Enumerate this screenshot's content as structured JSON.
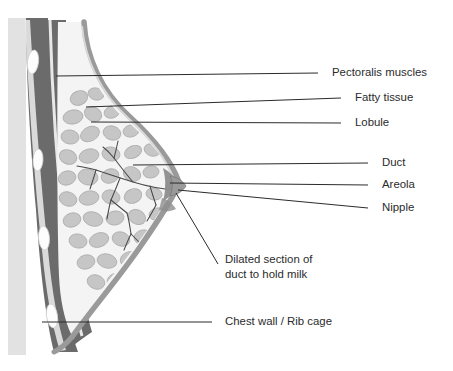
{
  "diagram": {
    "background_color": "#ffffff",
    "line_color": "#2b2b2b",
    "text_color": "#2b2b2b",
    "palette": {
      "muscle_dark": "#6b6b6b",
      "skin_band": "#9a9a9a",
      "lobule_gray": "#c6c6c6",
      "lobule_edge": "#b0b0b0",
      "tissue_light": "#f4f4f4",
      "rib_white": "#fdfdfd",
      "chest_wall_light": "#e2e2e2",
      "duct_line": "#4a4a4a",
      "areola_gray": "#8d8d8d"
    },
    "labels": [
      {
        "id": "pectoralis-muscles",
        "text": "Pectoralis muscles",
        "text_x": 332,
        "text_y": 73,
        "leader_points": "56,76 318,73",
        "anchor_structure": "pectoralis muscle band"
      },
      {
        "id": "fatty-tissue",
        "text": "Fatty tissue",
        "text_x": 355,
        "text_y": 98,
        "leader_points": "86,107 341,98",
        "anchor_structure": "fatty tissue between lobules"
      },
      {
        "id": "lobule",
        "text": "Lobule",
        "text_x": 355,
        "text_y": 123,
        "leader_points": "91,122 341,123",
        "anchor_structure": "lobule cluster"
      },
      {
        "id": "duct",
        "text": "Duct",
        "text_x": 382,
        "text_y": 163,
        "leader_points": "133,165 368,163",
        "anchor_structure": "milk duct"
      },
      {
        "id": "areola",
        "text": "Areola",
        "text_x": 382,
        "text_y": 185,
        "leader_points": "170,183 368,185",
        "anchor_structure": "areola"
      },
      {
        "id": "nipple",
        "text": "Nipple",
        "text_x": 382,
        "text_y": 208,
        "leader_points": "178,190 368,208",
        "anchor_structure": "nipple tip"
      },
      {
        "id": "dilated-section",
        "text_line1": "Dilated section of",
        "text_line2": "duct to hold milk",
        "text_x": 225,
        "text_y": 260,
        "line_height": 15,
        "leader_points": "176,193 218,264",
        "anchor_structure": "lactiferous sinus"
      },
      {
        "id": "chest-wall-rib-cage",
        "text": "Chest wall / Rib cage",
        "text_x": 225,
        "text_y": 322,
        "leader_points": "42,322 212,322",
        "anchor_structure": "chest wall and rib cage"
      }
    ],
    "lobule_blobs": [
      {
        "cx": 79,
        "cy": 98,
        "rx": 9,
        "ry": 7,
        "rot": -22
      },
      {
        "cx": 96,
        "cy": 94,
        "rx": 8,
        "ry": 6,
        "rot": 14
      },
      {
        "cx": 73,
        "cy": 117,
        "rx": 10,
        "ry": 7,
        "rot": -10
      },
      {
        "cx": 93,
        "cy": 114,
        "rx": 9,
        "ry": 7,
        "rot": 28
      },
      {
        "cx": 112,
        "cy": 112,
        "rx": 8,
        "ry": 6,
        "rot": -18
      },
      {
        "cx": 70,
        "cy": 137,
        "rx": 9,
        "ry": 7,
        "rot": 8
      },
      {
        "cx": 90,
        "cy": 134,
        "rx": 10,
        "ry": 7,
        "rot": -26
      },
      {
        "cx": 112,
        "cy": 133,
        "rx": 9,
        "ry": 7,
        "rot": 16
      },
      {
        "cx": 131,
        "cy": 131,
        "rx": 8,
        "ry": 6,
        "rot": -12
      },
      {
        "cx": 68,
        "cy": 157,
        "rx": 9,
        "ry": 7,
        "rot": 22
      },
      {
        "cx": 89,
        "cy": 156,
        "rx": 10,
        "ry": 7,
        "rot": -14
      },
      {
        "cx": 111,
        "cy": 154,
        "rx": 9,
        "ry": 7,
        "rot": 10
      },
      {
        "cx": 133,
        "cy": 152,
        "rx": 9,
        "ry": 6,
        "rot": -24
      },
      {
        "cx": 152,
        "cy": 150,
        "rx": 8,
        "ry": 6,
        "rot": 18
      },
      {
        "cx": 67,
        "cy": 178,
        "rx": 9,
        "ry": 7,
        "rot": -16
      },
      {
        "cx": 88,
        "cy": 177,
        "rx": 10,
        "ry": 8,
        "rot": 12
      },
      {
        "cx": 110,
        "cy": 176,
        "rx": 9,
        "ry": 7,
        "rot": -20
      },
      {
        "cx": 132,
        "cy": 174,
        "rx": 9,
        "ry": 7,
        "rot": 24
      },
      {
        "cx": 151,
        "cy": 172,
        "rx": 8,
        "ry": 6,
        "rot": -8
      },
      {
        "cx": 68,
        "cy": 199,
        "rx": 9,
        "ry": 7,
        "rot": 20
      },
      {
        "cx": 89,
        "cy": 198,
        "rx": 10,
        "ry": 7,
        "rot": -12
      },
      {
        "cx": 111,
        "cy": 197,
        "rx": 9,
        "ry": 7,
        "rot": 14
      },
      {
        "cx": 133,
        "cy": 196,
        "rx": 9,
        "ry": 7,
        "rot": -22
      },
      {
        "cx": 154,
        "cy": 194,
        "rx": 8,
        "ry": 6,
        "rot": 10
      },
      {
        "cx": 72,
        "cy": 220,
        "rx": 9,
        "ry": 7,
        "rot": -18
      },
      {
        "cx": 93,
        "cy": 219,
        "rx": 10,
        "ry": 7,
        "rot": 16
      },
      {
        "cx": 115,
        "cy": 218,
        "rx": 9,
        "ry": 7,
        "rot": -10
      },
      {
        "cx": 137,
        "cy": 217,
        "rx": 9,
        "ry": 7,
        "rot": 26
      },
      {
        "cx": 157,
        "cy": 214,
        "rx": 8,
        "ry": 6,
        "rot": -14
      },
      {
        "cx": 78,
        "cy": 241,
        "rx": 9,
        "ry": 7,
        "rot": 12
      },
      {
        "cx": 99,
        "cy": 240,
        "rx": 10,
        "ry": 7,
        "rot": -20
      },
      {
        "cx": 121,
        "cy": 239,
        "rx": 9,
        "ry": 7,
        "rot": 18
      },
      {
        "cx": 143,
        "cy": 237,
        "rx": 9,
        "ry": 7,
        "rot": -12
      },
      {
        "cx": 163,
        "cy": 234,
        "rx": 8,
        "ry": 6,
        "rot": 22
      },
      {
        "cx": 86,
        "cy": 262,
        "rx": 9,
        "ry": 7,
        "rot": -16
      },
      {
        "cx": 107,
        "cy": 261,
        "rx": 10,
        "ry": 7,
        "rot": 14
      },
      {
        "cx": 129,
        "cy": 259,
        "rx": 9,
        "ry": 7,
        "rot": -24
      },
      {
        "cx": 150,
        "cy": 256,
        "rx": 9,
        "ry": 7,
        "rot": 10
      },
      {
        "cx": 168,
        "cy": 252,
        "rx": 8,
        "ry": 6,
        "rot": -18
      },
      {
        "cx": 96,
        "cy": 282,
        "rx": 9,
        "ry": 7,
        "rot": 20
      },
      {
        "cx": 117,
        "cy": 280,
        "rx": 10,
        "ry": 7,
        "rot": -12
      },
      {
        "cx": 139,
        "cy": 277,
        "rx": 9,
        "ry": 7,
        "rot": 16
      },
      {
        "cx": 159,
        "cy": 273,
        "rx": 8,
        "ry": 6,
        "rot": -20
      },
      {
        "cx": 110,
        "cy": 300,
        "rx": 9,
        "ry": 7,
        "rot": -14
      },
      {
        "cx": 131,
        "cy": 297,
        "rx": 9,
        "ry": 7,
        "rot": 18
      },
      {
        "cx": 150,
        "cy": 292,
        "rx": 8,
        "ry": 6,
        "rot": -10
      }
    ],
    "ribs": [
      {
        "cx": 33,
        "cy": 62,
        "rx": 5.5,
        "ry": 12,
        "rot": 7
      },
      {
        "cx": 38,
        "cy": 160,
        "rx": 5,
        "ry": 11,
        "rot": 3
      },
      {
        "cx": 44,
        "cy": 238,
        "rx": 5.5,
        "ry": 12,
        "rot": -4
      },
      {
        "cx": 52,
        "cy": 316,
        "rx": 5.5,
        "ry": 12,
        "rot": -8
      }
    ],
    "duct_tree_paths": [
      "M176,190 C160,189 146,186 133,182 C120,178 108,174 96,170",
      "M133,182 C126,174 120,166 114,158",
      "M114,158 C110,153 107,150 103,147",
      "M114,158 C116,151 117,146 118,141",
      "M120,178 C117,186 114,193 111,200",
      "M111,200 C109,207 108,213 107,219",
      "M111,200 C117,205 122,209 127,213",
      "M127,213 C129,220 130,227 131,234",
      "M131,234 C128,240 126,245 124,250",
      "M131,234 C136,239 140,243 144,247",
      "M96,170 C89,168 83,167 77,166",
      "M96,170 C94,177 92,183 90,189",
      "M150,186 C152,193 154,199 156,205",
      "M156,205 C153,211 150,216 147,221"
    ]
  }
}
